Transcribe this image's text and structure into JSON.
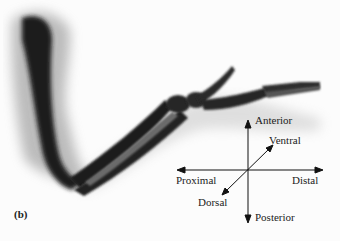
{
  "figure": {
    "panel_label": "(b)",
    "orientation_axes": {
      "anterior": "Anterior",
      "posterior": "Posterior",
      "proximal": "Proximal",
      "distal": "Distal",
      "ventral": "Ventral",
      "dorsal": "Dorsal"
    }
  }
}
